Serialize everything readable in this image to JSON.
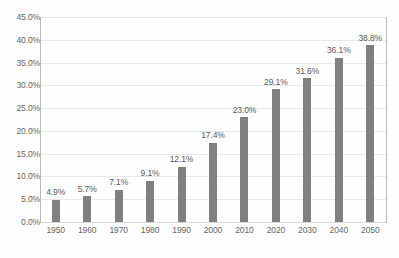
{
  "chart_data": {
    "type": "bar",
    "title": "",
    "subtitle": "",
    "xlabel": "",
    "ylabel": "",
    "categories": [
      "1950",
      "1960",
      "1970",
      "1980",
      "1990",
      "2000",
      "2010",
      "2020",
      "2030",
      "2040",
      "2050"
    ],
    "values": [
      4.9,
      5.7,
      7.1,
      9.1,
      12.1,
      17.4,
      23.0,
      29.1,
      31.6,
      36.1,
      38.8
    ],
    "data_labels": [
      "4.9%",
      "5.7%",
      "7.1%",
      "9.1%",
      "12.1%",
      "17.4%",
      "23.0%",
      "29.1%",
      "31.6%",
      "36.1%",
      "38.8%"
    ],
    "ylim": [
      0,
      45
    ],
    "ytick_values": [
      0,
      5,
      10,
      15,
      20,
      25,
      30,
      35,
      40,
      45
    ],
    "ytick_labels": [
      "0.0%",
      "5.0%",
      "10.0%",
      "15.0%",
      "20.0%",
      "25.0%",
      "30.0%",
      "35.0%",
      "40.0%",
      "45.0%"
    ],
    "grid": true,
    "legend": false,
    "legend_position": "none",
    "series": [
      {
        "name": "",
        "values": [
          4.9,
          5.7,
          7.1,
          9.1,
          12.1,
          17.4,
          23.0,
          29.1,
          31.6,
          36.1,
          38.8
        ],
        "color": "#808080"
      }
    ],
    "colors": {
      "bar": "#808080",
      "gridline": "#e8e8e8",
      "axis_line": "#b8b8b8",
      "tick_text": "#666666",
      "data_label_text": "#5a5a5a",
      "background": "#fefefe"
    }
  }
}
